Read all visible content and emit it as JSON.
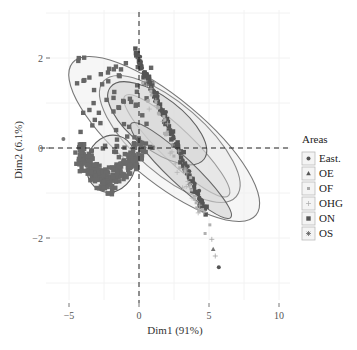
{
  "chart_data": {
    "type": "scatter",
    "title": "",
    "xlabel": "Dim1 (91%)",
    "ylabel": "Dim2 (6.1%)",
    "xlim": [
      -6.6,
      12.5
    ],
    "ylim": [
      -3.3,
      3.2
    ],
    "x_ticks": [
      -5,
      0,
      5,
      10
    ],
    "y_ticks": [
      -2,
      0,
      2
    ],
    "grid": true,
    "reference_lines": {
      "x": 0,
      "y": 0,
      "style": "dashed"
    },
    "legend": {
      "title": "Areas",
      "position": "right",
      "entries": [
        {
          "name": "East.",
          "marker": "circle"
        },
        {
          "name": "OE",
          "marker": "triangle"
        },
        {
          "name": "OF",
          "marker": "square-small"
        },
        {
          "name": "OHG",
          "marker": "plus"
        },
        {
          "name": "ON",
          "marker": "square"
        },
        {
          "name": "OS",
          "marker": "asterisk"
        }
      ]
    },
    "series": [
      {
        "name": "East.",
        "center": [
          -2.0,
          -0.5
        ],
        "ellipse": {
          "cx": -2.0,
          "cy": -0.35,
          "rx": 2.8,
          "ry": 1.55,
          "angle": -10
        },
        "color": "#606060",
        "fill": "#e4e4e4"
      },
      {
        "name": "OE",
        "center": [
          1.2,
          0.6
        ],
        "ellipse": {
          "cx": 1.8,
          "cy": 0.2,
          "rx": 6.6,
          "ry": 2.9,
          "angle": -44
        },
        "color": "#777777",
        "fill": "#efefef"
      },
      {
        "name": "OF",
        "center": [
          1.5,
          0.4
        ],
        "ellipse": {
          "cx": 2.2,
          "cy": 0.2,
          "rx": 4.6,
          "ry": 2.6,
          "angle": -48
        },
        "color": "#888888",
        "fill": "#eaeaea"
      },
      {
        "name": "OHG",
        "center": [
          2.5,
          0.0
        ],
        "ellipse": {
          "cx": 2.7,
          "cy": 0.05,
          "rx": 3.3,
          "ry": 1.5,
          "angle": -60
        },
        "color": "#999999",
        "fill": "#e0e0e0"
      },
      {
        "name": "ON",
        "center": [
          0.8,
          0.9
        ],
        "ellipse": {
          "cx": 1.3,
          "cy": 0.55,
          "rx": 3.6,
          "ry": 1.7,
          "angle": -38
        },
        "color": "#606060",
        "fill": "#d4d4d4"
      },
      {
        "name": "OS",
        "center": [
          2.8,
          -0.4
        ],
        "ellipse": {
          "cx": 3.0,
          "cy": -0.5,
          "rx": 3.2,
          "ry": 1.15,
          "angle": -58
        },
        "color": "#666666",
        "fill": "#cfcfcf"
      }
    ]
  }
}
